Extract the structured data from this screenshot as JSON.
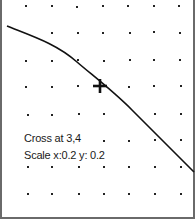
{
  "plot": {
    "cross_text": "Cross at 3,4",
    "scale_text": "Scale x:0.2 y: 0.2",
    "grid_color": "#222222",
    "curve_color": "#111111",
    "border_color": "#6a6a6a"
  }
}
